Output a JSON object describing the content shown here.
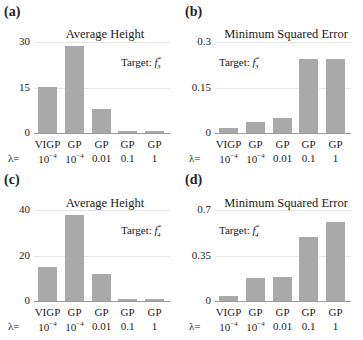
{
  "chart_data": [
    {
      "panel": "(a)",
      "type": "bar",
      "title": "Average Height",
      "annotation": "Target: f3*",
      "categories": [
        "VIGP λ=10^-4",
        "GP λ=10^-4",
        "GP λ=0.01",
        "GP λ=0.1",
        "GP λ=1"
      ],
      "values": [
        15.3,
        28.8,
        8.0,
        0.8,
        0.8
      ],
      "yticks": [
        0,
        15,
        30
      ],
      "ylim": [
        0,
        30
      ],
      "grid": true
    },
    {
      "panel": "(b)",
      "type": "bar",
      "title": "Minimum Squared Error",
      "annotation": "Target: f3*",
      "categories": [
        "VIGP λ=10^-4",
        "GP λ=10^-4",
        "GP λ=0.01",
        "GP λ=0.1",
        "GP λ=1"
      ],
      "values": [
        0.017,
        0.037,
        0.05,
        0.245,
        0.245
      ],
      "yticks": [
        0,
        0.15,
        0.3
      ],
      "ylim": [
        0,
        0.3
      ],
      "grid": true
    },
    {
      "panel": "(c)",
      "type": "bar",
      "title": "Average Height",
      "annotation": "Target: f4*",
      "categories": [
        "VIGP λ=10^-4",
        "GP λ=10^-4",
        "GP λ=0.01",
        "GP λ=0.1",
        "GP λ=1"
      ],
      "values": [
        14.8,
        38.0,
        11.8,
        1.0,
        1.0
      ],
      "yticks": [
        0,
        20,
        40
      ],
      "ylim": [
        0,
        40
      ],
      "grid": true
    },
    {
      "panel": "(d)",
      "type": "bar",
      "title": "Minimum Squared Error",
      "annotation": "Target: f4*",
      "categories": [
        "VIGP λ=10^-4",
        "GP λ=10^-4",
        "GP λ=0.01",
        "GP λ=0.1",
        "GP λ=1"
      ],
      "values": [
        0.04,
        0.18,
        0.185,
        0.49,
        0.61
      ],
      "yticks": [
        0,
        0.35,
        0.7
      ],
      "ylim": [
        0,
        0.7
      ],
      "grid": true
    }
  ],
  "panels": [
    {
      "label": "(a)",
      "title": "Average Height",
      "target_text": "Target:",
      "target_sub": "3",
      "ticks": [
        "30",
        "15",
        "0"
      ]
    },
    {
      "label": "(b)",
      "title": "Minimum Squared Error",
      "target_text": "Target:",
      "target_sub": "3",
      "ticks": [
        "0.3",
        "0.15",
        "0"
      ]
    },
    {
      "label": "(c)",
      "title": "Average Height",
      "target_text": "Target:",
      "target_sub": "4",
      "ticks": [
        "40",
        "20",
        "0"
      ]
    },
    {
      "label": "(d)",
      "title": "Minimum Squared Error",
      "target_text": "Target:",
      "target_sub": "4",
      "ticks": [
        "0.7",
        "0.35",
        "0"
      ]
    }
  ],
  "methods": [
    "VIGP",
    "GP",
    "GP",
    "GP",
    "GP"
  ],
  "lambda_label": "λ=",
  "lambda_exp_base": "10",
  "lambda_exp": "−4",
  "lambda_values": [
    "0.01",
    "0.1",
    "1"
  ],
  "target_fn": "f",
  "target_star": "*"
}
